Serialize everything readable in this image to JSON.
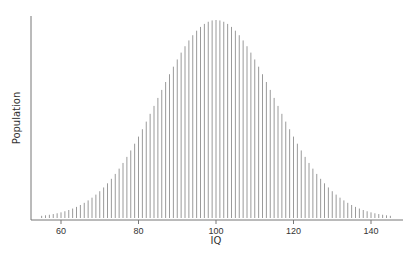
{
  "chart_data": {
    "type": "bar",
    "title": "",
    "xlabel": "IQ",
    "ylabel": "Population",
    "xlim": [
      52,
      150
    ],
    "x_ticks": [
      60,
      80,
      100,
      120,
      140
    ],
    "grid": false,
    "legend": null,
    "distribution": {
      "kind": "normal",
      "mean": 100,
      "sd": 15
    },
    "x": [
      55,
      56,
      57,
      58,
      59,
      60,
      61,
      62,
      63,
      64,
      65,
      66,
      67,
      68,
      69,
      70,
      71,
      72,
      73,
      74,
      75,
      76,
      77,
      78,
      79,
      80,
      81,
      82,
      83,
      84,
      85,
      86,
      87,
      88,
      89,
      90,
      91,
      92,
      93,
      94,
      95,
      96,
      97,
      98,
      99,
      100,
      101,
      102,
      103,
      104,
      105,
      106,
      107,
      108,
      109,
      110,
      111,
      112,
      113,
      114,
      115,
      116,
      117,
      118,
      119,
      120,
      121,
      122,
      123,
      124,
      125,
      126,
      127,
      128,
      129,
      130,
      131,
      132,
      133,
      134,
      135,
      136,
      137,
      138,
      139,
      140,
      141,
      142,
      143,
      144,
      145
    ],
    "values_relative": "computed as exp(-((x-100)^2)/(2*15^2)), peak = 1.0 at IQ 100",
    "bar_color": "#9a9a9a",
    "axis_color": "#777777"
  }
}
